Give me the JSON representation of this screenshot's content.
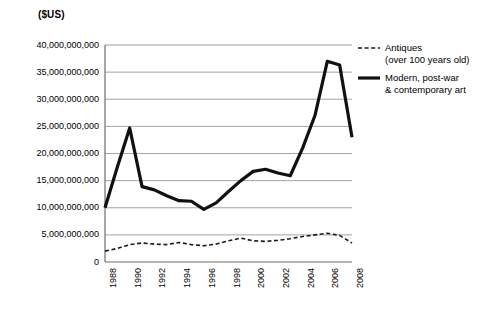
{
  "chart_data": {
    "type": "line",
    "title": "",
    "xlabel": "",
    "ylabel": "($US)",
    "unit_caption": "($US)",
    "x": [
      1988,
      1989,
      1990,
      1991,
      1992,
      1993,
      1994,
      1995,
      1996,
      1997,
      1998,
      1999,
      2000,
      2001,
      2002,
      2003,
      2004,
      2005,
      2006,
      2007,
      2008
    ],
    "xlim": [
      1988,
      2008
    ],
    "ylim": [
      0,
      40000000000
    ],
    "ytick_step": 5000000000,
    "grid": true,
    "legend_position": "top-right-outside",
    "yticks": [
      {
        "value": 40000000000,
        "label": "40,000,000,000"
      },
      {
        "value": 35000000000,
        "label": "35,000,000,000"
      },
      {
        "value": 30000000000,
        "label": "30,000,000,000"
      },
      {
        "value": 25000000000,
        "label": "25,000,000,000"
      },
      {
        "value": 20000000000,
        "label": "20,000,000,000"
      },
      {
        "value": 15000000000,
        "label": "15,000,000,000"
      },
      {
        "value": 10000000000,
        "label": "10,000,000,000"
      },
      {
        "value": 5000000000,
        "label": "5,000,000,000"
      },
      {
        "value": 0,
        "label": "0"
      }
    ],
    "xticks": [
      {
        "value": 1988,
        "label": "1988"
      },
      {
        "value": 1990,
        "label": "1990"
      },
      {
        "value": 1992,
        "label": "1992"
      },
      {
        "value": 1994,
        "label": "1994"
      },
      {
        "value": 1996,
        "label": "1996"
      },
      {
        "value": 1998,
        "label": "1998"
      },
      {
        "value": 2000,
        "label": "2000"
      },
      {
        "value": 2002,
        "label": "2002"
      },
      {
        "value": 2004,
        "label": "2004"
      },
      {
        "value": 2006,
        "label": "2006"
      },
      {
        "value": 2008,
        "label": "2008"
      }
    ],
    "series": [
      {
        "name": "Antiques\n(over 100 years old)",
        "legend_label": "Antiques\n(over 100 years old)",
        "style": "dashed",
        "color": "#1a1a1a",
        "width": 1.6,
        "values": [
          2000000000,
          2500000000,
          3200000000,
          3500000000,
          3300000000,
          3200000000,
          3600000000,
          3200000000,
          3000000000,
          3300000000,
          3900000000,
          4400000000,
          3900000000,
          3800000000,
          4000000000,
          4300000000,
          4700000000,
          5000000000,
          5300000000,
          4900000000,
          3500000000
        ]
      },
      {
        "name": "Modern, post-war\n& contemporary art",
        "legend_label": "Modern, post-war\n& contemporary art",
        "style": "solid",
        "color": "#111111",
        "width": 3.2,
        "values": [
          10000000000,
          17500000000,
          24700000000,
          13900000000,
          13300000000,
          12200000000,
          11300000000,
          11200000000,
          9700000000,
          10900000000,
          13000000000,
          15000000000,
          16700000000,
          17100000000,
          16400000000,
          15900000000,
          21000000000,
          27000000000,
          37000000000,
          36300000000,
          23000000000
        ]
      }
    ]
  }
}
